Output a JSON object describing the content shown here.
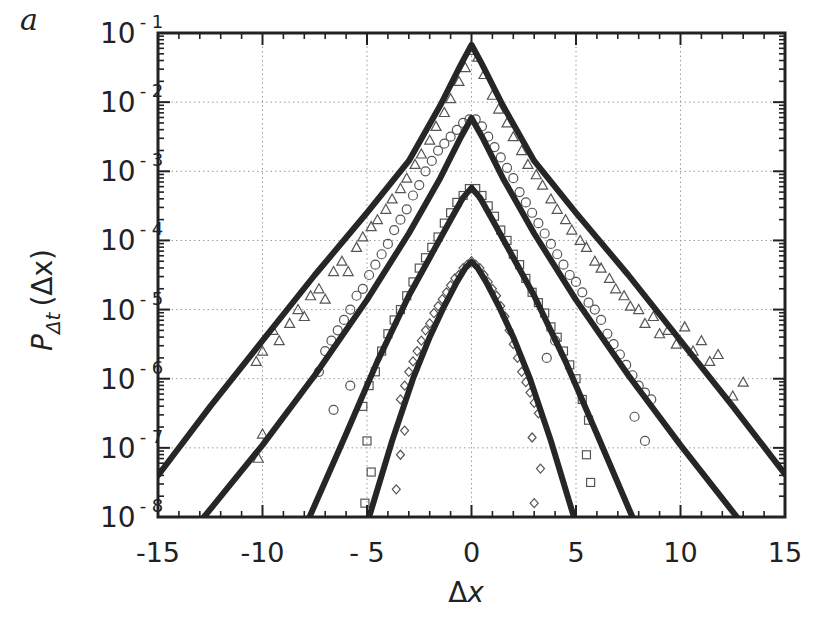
{
  "panel_label": "a",
  "chart_data": {
    "type": "line",
    "title": "",
    "xlabel": "Δx",
    "ylabel": "P_Δt (Δx)",
    "ylabel_parts": {
      "main": "P",
      "sub": "Δt",
      "arg": "(Δx)"
    },
    "xlim": [
      -15,
      15
    ],
    "ylim": [
      1e-08,
      0.1
    ],
    "yscale": "log",
    "grid": true,
    "grid_style": "dotted",
    "x_ticks": [
      -15,
      -10,
      -5,
      0,
      5,
      10,
      15
    ],
    "x_tick_labels": [
      "-15",
      "-10",
      "- 5",
      "0",
      "5",
      "10",
      "15"
    ],
    "x_gridlines": [
      -10,
      -5,
      0,
      5,
      10
    ],
    "y_tick_exponents": [
      -1,
      -2,
      -3,
      -4,
      -5,
      -6,
      -7,
      -8
    ],
    "y_tick_labels": [
      "10⁻¹",
      "10⁻²",
      "10⁻³",
      "10⁻⁴",
      "10⁻⁵",
      "10⁻⁶",
      "10⁻⁷",
      "10⁻⁸"
    ],
    "y_gridlines": [
      -2,
      -3,
      -4,
      -5,
      -6,
      -7
    ],
    "legend": "none",
    "series": [
      {
        "name": "triangles",
        "marker": "triangle",
        "fit_line": {
          "x": [
            -15,
            -12.5,
            -10,
            -7.5,
            -5,
            -3,
            -1.5,
            -0.5,
            0,
            0.5,
            1.5,
            3,
            5,
            7.5,
            10,
            12.5,
            15
          ],
          "log10_y": [
            -7.4,
            -6.4,
            -5.45,
            -4.5,
            -3.6,
            -2.85,
            -2.05,
            -1.45,
            -1.17,
            -1.45,
            -2.05,
            -2.85,
            -3.6,
            -4.5,
            -5.45,
            -6.4,
            -7.38
          ]
        },
        "points": {
          "x": [
            -10.3,
            -10,
            -9.5,
            -9.2,
            -8.7,
            -8.3,
            -8,
            -7.7,
            -7.3,
            -7,
            -6.6,
            -6.2,
            -5.9,
            -5.5,
            -5.2,
            -4.8,
            -4.5,
            -4.1,
            -3.8,
            -3.4,
            -3.1,
            -2.7,
            -2.4,
            -2.0,
            -1.7,
            -1.3,
            -1.0,
            -0.6,
            -0.3,
            0,
            0.3,
            0.6,
            1.0,
            1.3,
            1.7,
            2.0,
            2.4,
            2.7,
            3.1,
            3.4,
            3.8,
            4.1,
            4.5,
            4.8,
            5.2,
            5.5,
            5.9,
            6.2,
            6.6,
            6.9,
            7.3,
            7.6,
            8,
            8.3,
            8.7,
            9,
            9.4,
            9.8,
            10.2,
            10.6,
            11,
            11.4,
            11.8,
            -10,
            -10.2,
            12.5,
            13
          ],
          "log10_y": [
            -5.75,
            -5.6,
            -5.3,
            -5.45,
            -5.2,
            -5.0,
            -5.1,
            -4.8,
            -4.7,
            -4.85,
            -4.45,
            -4.3,
            -4.45,
            -4.1,
            -3.95,
            -3.8,
            -3.7,
            -3.55,
            -3.4,
            -3.25,
            -3.1,
            -2.9,
            -2.75,
            -2.55,
            -2.35,
            -2.15,
            -1.95,
            -1.7,
            -1.5,
            -1.25,
            -1.35,
            -1.6,
            -1.9,
            -2.1,
            -2.3,
            -2.5,
            -2.7,
            -2.9,
            -3.05,
            -3.2,
            -3.4,
            -3.55,
            -3.7,
            -3.85,
            -4.0,
            -4.1,
            -4.3,
            -4.4,
            -4.55,
            -4.7,
            -4.8,
            -4.95,
            -5.0,
            -5.2,
            -5.1,
            -5.35,
            -5.3,
            -5.5,
            -5.25,
            -5.6,
            -5.45,
            -5.75,
            -5.65,
            -6.8,
            -7.15,
            -6.25,
            -6.05
          ]
        }
      },
      {
        "name": "circles",
        "marker": "circle",
        "fit_line": {
          "x": [
            -12.8,
            -10,
            -7.5,
            -5,
            -3,
            -1.5,
            -0.5,
            0,
            0.5,
            1.5,
            3,
            5,
            7.5,
            10,
            12.7
          ],
          "log10_y": [
            -8,
            -6.96,
            -5.95,
            -4.86,
            -3.9,
            -3.1,
            -2.5,
            -2.23,
            -2.5,
            -3.1,
            -3.9,
            -4.86,
            -5.95,
            -6.96,
            -8
          ]
        },
        "points": {
          "x": [
            -7.3,
            -7,
            -6.7,
            -6.4,
            -6.1,
            -5.8,
            -5.5,
            -5.2,
            -4.9,
            -4.6,
            -4.3,
            -4.0,
            -3.7,
            -3.4,
            -3.1,
            -2.8,
            -2.5,
            -2.2,
            -1.9,
            -1.6,
            -1.3,
            -1.0,
            -0.7,
            -0.4,
            -0.1,
            0.2,
            0.5,
            0.8,
            1.1,
            1.4,
            1.7,
            2.0,
            2.3,
            2.6,
            2.9,
            3.2,
            3.5,
            3.8,
            4.1,
            4.4,
            4.7,
            5.0,
            5.3,
            5.6,
            5.9,
            6.2,
            6.5,
            6.8,
            7.1,
            7.4,
            7.7,
            8.0,
            8.3,
            8.6,
            -6.6,
            -5.8,
            3.6,
            4,
            7.8,
            8.3
          ],
          "log10_y": [
            -5.9,
            -5.6,
            -5.45,
            -5.3,
            -5.15,
            -5.0,
            -4.8,
            -4.7,
            -4.5,
            -4.35,
            -4.2,
            -4.05,
            -3.85,
            -3.7,
            -3.55,
            -3.35,
            -3.2,
            -3.0,
            -2.85,
            -2.7,
            -2.6,
            -2.5,
            -2.4,
            -2.3,
            -2.25,
            -2.25,
            -2.35,
            -2.5,
            -2.65,
            -2.8,
            -2.95,
            -3.1,
            -3.3,
            -3.45,
            -3.6,
            -3.75,
            -3.9,
            -4.05,
            -4.2,
            -4.35,
            -4.5,
            -4.6,
            -4.75,
            -4.9,
            -5.0,
            -5.15,
            -5.35,
            -5.5,
            -5.65,
            -5.8,
            -5.95,
            -6.1,
            -6.2,
            -6.3,
            -6.45,
            -6.1,
            -5.7,
            -5.45,
            -6.55,
            -6.9
          ]
        }
      },
      {
        "name": "squares",
        "marker": "square",
        "fit_line": {
          "x": [
            -7.75,
            -6,
            -4.5,
            -3,
            -2,
            -1,
            -0.4,
            0,
            0.4,
            1,
            2,
            3,
            4.5,
            6,
            7.7
          ],
          "log10_y": [
            -8,
            -6.8,
            -5.75,
            -4.8,
            -4.25,
            -3.7,
            -3.38,
            -3.24,
            -3.38,
            -3.7,
            -4.25,
            -4.8,
            -5.75,
            -6.8,
            -8
          ]
        },
        "points": {
          "x": [
            -5.2,
            -4.9,
            -4.6,
            -4.3,
            -4.0,
            -3.7,
            -3.4,
            -3.1,
            -2.8,
            -2.5,
            -2.2,
            -1.9,
            -1.6,
            -1.3,
            -1.0,
            -0.7,
            -0.4,
            -0.1,
            0.2,
            0.5,
            0.8,
            1.1,
            1.4,
            1.7,
            2.0,
            2.3,
            2.6,
            2.9,
            3.2,
            3.5,
            3.8,
            4.1,
            4.4,
            4.7,
            5.0,
            5.3,
            5.6,
            -5.0,
            -4.8,
            -5.1,
            5.5,
            5.7
          ],
          "log10_y": [
            -6.4,
            -6.1,
            -5.9,
            -5.6,
            -5.35,
            -5.15,
            -5.0,
            -4.8,
            -4.6,
            -4.4,
            -4.25,
            -4.1,
            -3.95,
            -3.75,
            -3.6,
            -3.45,
            -3.35,
            -3.25,
            -3.25,
            -3.35,
            -3.5,
            -3.65,
            -3.85,
            -4.0,
            -4.2,
            -4.35,
            -4.55,
            -4.75,
            -4.9,
            -5.05,
            -5.25,
            -5.4,
            -5.6,
            -5.8,
            -6.0,
            -6.3,
            -6.6,
            -6.9,
            -7.35,
            -7.8,
            -7.1,
            -7.5
          ]
        }
      },
      {
        "name": "diamonds",
        "marker": "diamond",
        "fit_line": {
          "x": [
            -4.9,
            -3.8,
            -2.8,
            -2,
            -1.3,
            -0.7,
            -0.3,
            0,
            0.3,
            0.7,
            1.3,
            2,
            2.8,
            3.8,
            4.9
          ],
          "log10_y": [
            -8,
            -6.9,
            -6.0,
            -5.4,
            -4.95,
            -4.6,
            -4.4,
            -4.31,
            -4.4,
            -4.6,
            -4.95,
            -5.4,
            -6.0,
            -6.9,
            -8
          ]
        },
        "points": {
          "x": [
            -3.4,
            -3.2,
            -3.0,
            -2.8,
            -2.6,
            -2.4,
            -2.2,
            -2.0,
            -1.8,
            -1.6,
            -1.4,
            -1.2,
            -1.0,
            -0.8,
            -0.6,
            -0.4,
            -0.2,
            0.0,
            0.2,
            0.4,
            0.6,
            0.8,
            1.0,
            1.2,
            1.4,
            1.6,
            1.8,
            2.0,
            2.2,
            2.4,
            2.6,
            2.8,
            3.0,
            3.2,
            -3.2,
            -3.4,
            -3.6,
            2.9,
            3.3,
            3.0
          ],
          "log10_y": [
            -6.3,
            -6.1,
            -5.9,
            -5.75,
            -5.6,
            -5.45,
            -5.3,
            -5.2,
            -5.05,
            -4.95,
            -4.85,
            -4.75,
            -4.65,
            -4.55,
            -4.5,
            -4.4,
            -4.35,
            -4.3,
            -4.35,
            -4.4,
            -4.5,
            -4.6,
            -4.7,
            -4.8,
            -4.95,
            -5.1,
            -5.3,
            -5.5,
            -5.7,
            -5.9,
            -6.05,
            -6.2,
            -6.35,
            -6.5,
            -6.75,
            -7.1,
            -7.6,
            -6.85,
            -7.3,
            -7.8
          ]
        }
      }
    ]
  }
}
